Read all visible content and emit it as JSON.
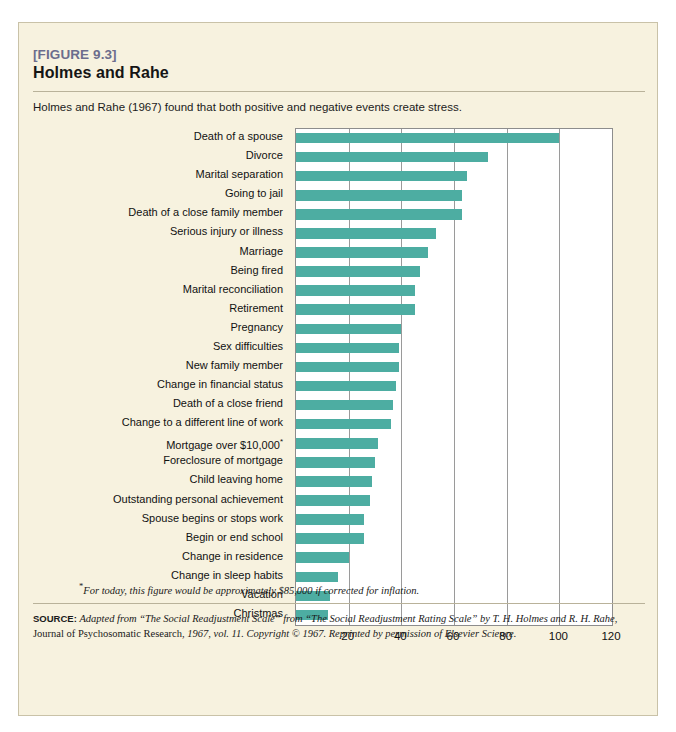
{
  "figure": {
    "label": "[FIGURE 9.3]",
    "title": "Holmes and Rahe",
    "caption": "Holmes and Rahe (1967) found that both positive and negative events create stress.",
    "footnote_marker": "*",
    "footnote": "For today, this figure would be approximately $85,000 if corrected for inflation.",
    "source_key": "SOURCE:",
    "source_text_1": "Adapted from “The Social Readjustment Scale” from “The Social Readjustment Rating Scale” by T. H. Holmes and R. H. Rahe,",
    "source_text_2": "Journal of Psychosomatic Research,",
    "source_text_3": "1967, vol. 11. Copyright © 1967. Reprinted by permission of Elsevier Science."
  },
  "colors": {
    "bar": "#4dada2",
    "card_background": "#f7f2df",
    "card_border": "#c9c2a8",
    "plot_background": "#ffffff",
    "gridline": "#9a9a9a",
    "label_accent": "#6c6d8d"
  },
  "chart_data": {
    "type": "bar",
    "orientation": "horizontal",
    "title": "Holmes and Rahe",
    "xlabel": "",
    "ylabel": "",
    "xlim": [
      0,
      120
    ],
    "xticks": [
      20,
      40,
      60,
      80,
      100,
      120
    ],
    "grid": "vertical",
    "legend": "none",
    "categories": [
      "Death of a spouse",
      "Divorce",
      "Marital separation",
      "Going to jail",
      "Death of a close family member",
      "Serious injury or illness",
      "Marriage",
      "Being fired",
      "Marital reconciliation",
      "Retirement",
      "Pregnancy",
      "Sex difficulties",
      "New family member",
      "Change in financial status",
      "Death of a close friend",
      "Change to a different line of work",
      "Mortgage over $10,000*",
      "Foreclosure of mortgage",
      "Child leaving home",
      "Outstanding personal achievement",
      "Spouse begins or stops work",
      "Begin or end school",
      "Change in residence",
      "Change in sleep habits",
      "Vacation",
      "Christmas"
    ],
    "values": [
      100,
      73,
      65,
      63,
      63,
      53,
      50,
      47,
      45,
      45,
      40,
      39,
      39,
      38,
      37,
      36,
      31,
      30,
      29,
      28,
      26,
      26,
      20,
      16,
      13,
      12
    ]
  }
}
